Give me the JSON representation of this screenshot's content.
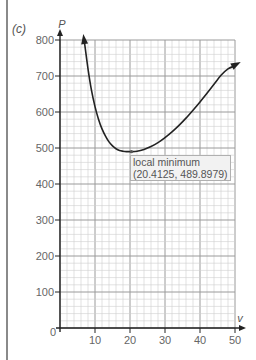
{
  "part_label": "(c)",
  "chart_data": {
    "type": "line",
    "title": "",
    "xlabel": "v",
    "ylabel": "P",
    "xlim": [
      0,
      50
    ],
    "ylim": [
      0,
      800
    ],
    "grid": true,
    "x_ticks": [
      0,
      10,
      20,
      30,
      40,
      50
    ],
    "y_ticks": [
      100,
      200,
      300,
      400,
      500,
      600,
      700,
      800
    ],
    "x_tick_labels": [
      "10",
      "20",
      "30",
      "40",
      "50"
    ],
    "y_tick_labels": [
      "100",
      "200",
      "300",
      "400",
      "500",
      "600",
      "700",
      "800"
    ],
    "origin_label": "0",
    "series": [
      {
        "name": "P(v)",
        "x": [
          6.9,
          8,
          9,
          10,
          11,
          12,
          13,
          14,
          15,
          16,
          17,
          18,
          19,
          20,
          20.4125,
          22,
          24,
          26,
          28,
          30,
          32,
          34,
          36,
          38,
          40,
          42,
          44,
          46,
          48,
          50
        ],
        "y": [
          800,
          720,
          660,
          615,
          580,
          553,
          533,
          517,
          506,
          498,
          493,
          491,
          490,
          490,
          489.9,
          491,
          496,
          504,
          515,
          529,
          545,
          563,
          583,
          605,
          628,
          652,
          677,
          702,
          720,
          728
        ]
      }
    ],
    "annotations": [
      {
        "text": "local minimum",
        "point": [
          20.4125,
          489.8979
        ],
        "coords_text": "(20.4125, 489.8979)"
      }
    ]
  },
  "annotation": {
    "line1": "local minimum",
    "line2": "(20.4125, 489.8979)"
  }
}
